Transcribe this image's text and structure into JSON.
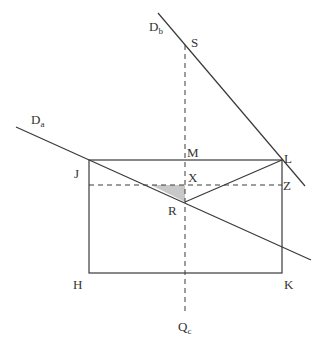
{
  "diagram": {
    "type": "geometry",
    "colors": {
      "line": "#3a3a3a",
      "dashed": "#3a3a3a",
      "shade": "#c8c8c8",
      "background": "#ffffff"
    },
    "labels": {
      "Db": {
        "main": "D",
        "sub": "b"
      },
      "Da": {
        "main": "D",
        "sub": "a"
      },
      "Qc": {
        "main": "Q",
        "sub": "c"
      },
      "S": "S",
      "M": "M",
      "L": "L",
      "J": "J",
      "X": "X",
      "Z": "Z",
      "R": "R",
      "H": "H",
      "K": "K"
    },
    "points": {
      "J": [
        89,
        160
      ],
      "L": [
        282,
        160
      ],
      "H": [
        89,
        273
      ],
      "K": [
        282,
        273
      ],
      "M": [
        185,
        160
      ],
      "X": [
        185,
        185
      ],
      "Z": [
        282,
        185
      ],
      "R": [
        185,
        202
      ],
      "S": [
        185,
        45
      ]
    },
    "lines": {
      "Db": [
        [
          158,
          13
        ],
        [
          305,
          186
        ]
      ],
      "Da": [
        [
          16,
          127
        ],
        [
          311,
          260
        ]
      ],
      "RL": [
        [
          185,
          202
        ],
        [
          282,
          160
        ]
      ]
    },
    "dashed": {
      "vertical": [
        [
          185,
          45
        ],
        [
          185,
          315
        ]
      ],
      "horizontal": [
        [
          89,
          185
        ],
        [
          282,
          185
        ]
      ]
    },
    "shaded_triangle": [
      [
        151,
        185
      ],
      [
        185,
        185
      ],
      [
        185,
        202
      ]
    ]
  }
}
